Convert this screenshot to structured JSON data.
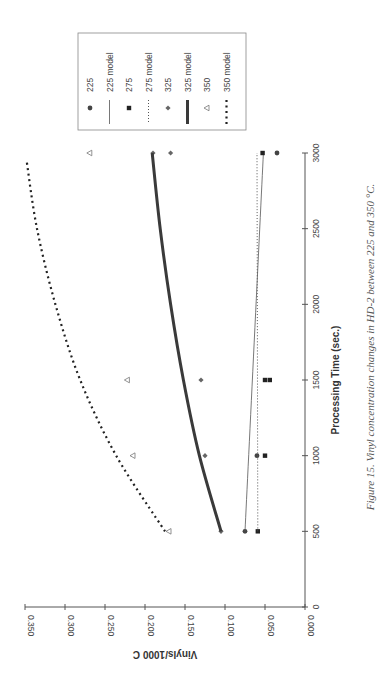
{
  "caption": "Figure 15. Vinyl concentration changes in HD-2 between 225 and 350 °C.",
  "chart_data": {
    "type": "scatter",
    "title": "",
    "xlabel": "Processing Time (sec.)",
    "ylabel": "Vinyls/1000 C",
    "xlim": [
      0,
      3000
    ],
    "ylim": [
      0,
      0.35
    ],
    "x_ticks": [
      "0",
      "500",
      "1000",
      "1500",
      "2000",
      "2500",
      "3000"
    ],
    "y_ticks": [
      "0.000",
      "0.050",
      "0.100",
      "0.150",
      "0.200",
      "0.250",
      "0.300",
      "0.350"
    ],
    "grid": false,
    "legend_position": "right (top-right of rotated page)",
    "orientation": "page rotated 90° counter-clockwise",
    "series": [
      {
        "name": "225",
        "kind": "points",
        "marker": "circle",
        "x": [
          500,
          1000,
          3000
        ],
        "y": [
          0.075,
          0.06,
          0.035
        ]
      },
      {
        "name": "225 model",
        "kind": "line",
        "style": "thin-solid",
        "x": [
          500,
          3000
        ],
        "y": [
          0.075,
          0.052
        ]
      },
      {
        "name": "275",
        "kind": "points",
        "marker": "square",
        "x": [
          500,
          1000,
          1500,
          1500,
          3000
        ],
        "y": [
          0.059,
          0.05,
          0.05,
          0.044,
          0.053
        ]
      },
      {
        "name": "275 model",
        "kind": "line",
        "style": "fine-dotted",
        "x": [
          500,
          3000
        ],
        "y": [
          0.059,
          0.06
        ]
      },
      {
        "name": "325",
        "kind": "points",
        "marker": "diamond",
        "x": [
          500,
          1000,
          1500,
          3000,
          3000
        ],
        "y": [
          0.105,
          0.125,
          0.13,
          0.19,
          0.168
        ]
      },
      {
        "name": "325 model",
        "kind": "line",
        "style": "thick-solid",
        "x": [
          500,
          1000,
          1500,
          2000,
          2500,
          3000
        ],
        "y": [
          0.105,
          0.132,
          0.152,
          0.168,
          0.181,
          0.191
        ]
      },
      {
        "name": "350",
        "kind": "points",
        "marker": "open-triangle",
        "x": [
          500,
          1000,
          1500,
          3000
        ],
        "y": [
          0.17,
          0.215,
          0.222,
          0.269
        ]
      },
      {
        "name": "350 model",
        "kind": "line",
        "style": "heavy-dotted",
        "x": [
          500,
          1000,
          1500,
          2000,
          2500,
          2950
        ],
        "y": [
          0.175,
          0.236,
          0.281,
          0.312,
          0.335,
          0.348
        ]
      }
    ]
  },
  "legend": {
    "items": [
      {
        "label": "225",
        "symbol": "circle-marker"
      },
      {
        "label": "225 model",
        "symbol": "thin-line"
      },
      {
        "label": "275",
        "symbol": "square-marker"
      },
      {
        "label": "275 model",
        "symbol": "dotted-line"
      },
      {
        "label": "325",
        "symbol": "diamond-marker"
      },
      {
        "label": "325 model",
        "symbol": "thick-line"
      },
      {
        "label": "350",
        "symbol": "triangle-marker"
      },
      {
        "label": "350 model",
        "symbol": "heavy-dotted-line"
      }
    ]
  },
  "colors": {
    "axis": "#555555",
    "marker": "#444444",
    "line": "#555555",
    "thick_line": "#3a3a3a",
    "legend_border": "#888888"
  }
}
